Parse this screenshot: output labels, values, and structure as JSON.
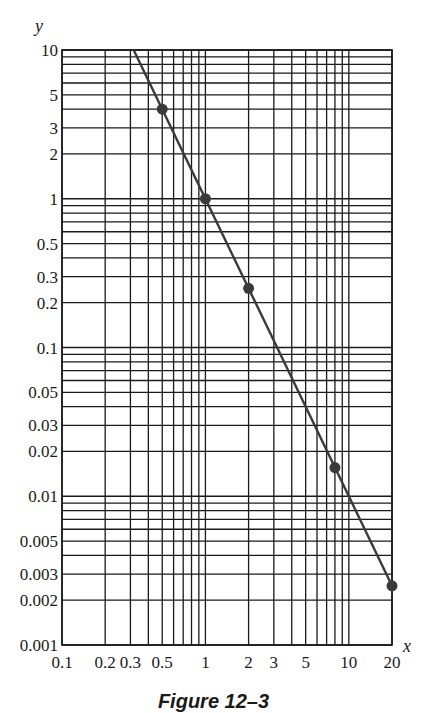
{
  "chart_data": {
    "type": "line",
    "title": "",
    "caption": "Figure 12–3",
    "xlabel": "x",
    "ylabel": "y",
    "xscale": "log",
    "yscale": "log",
    "xlim": [
      0.1,
      20
    ],
    "ylim": [
      0.001,
      10
    ],
    "grid": true,
    "legend": null,
    "x_tick_labels": [
      "0.1",
      "0.2",
      "0.3",
      "0.5",
      "1",
      "2",
      "3",
      "5",
      "10",
      "20"
    ],
    "x_ticks": [
      0.1,
      0.2,
      0.3,
      0.5,
      1,
      2,
      3,
      5,
      10,
      20
    ],
    "y_tick_labels": [
      "10",
      "5",
      "3",
      "2",
      "1",
      "0.5",
      "0.3",
      "0.2",
      "0.1",
      "0.05",
      "0.03",
      "0.02",
      "0.01",
      "0.005",
      "0.003",
      "0.002",
      "0.001"
    ],
    "y_ticks": [
      10,
      5,
      3,
      2,
      1,
      0.5,
      0.3,
      0.2,
      0.1,
      0.05,
      0.03,
      0.02,
      0.01,
      0.005,
      0.003,
      0.002,
      0.001
    ],
    "series": [
      {
        "name": "y = x^-2 (fitted line)",
        "type": "line",
        "x": [
          0.316,
          20
        ],
        "y": [
          10,
          0.0025
        ]
      },
      {
        "name": "data points",
        "type": "scatter",
        "x": [
          0.5,
          1,
          2,
          8,
          20
        ],
        "y": [
          4,
          1,
          0.25,
          0.0156,
          0.0025
        ]
      }
    ]
  },
  "colors": {
    "grid": "#1a1a1a",
    "line": "#3a3a3a",
    "points": "#3a3a3a",
    "background": "#ffffff"
  }
}
